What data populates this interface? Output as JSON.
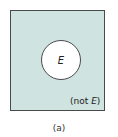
{
  "diagram": {
    "type": "venn",
    "colors": {
      "region_fill": "#cfe3e0",
      "event_fill": "#ffffff",
      "stroke": "#4a4a4a"
    },
    "event_label": "E",
    "complement_label_prefix": "(not ",
    "complement_label_var": "E",
    "complement_label_suffix": ")",
    "caption": "(a)"
  }
}
